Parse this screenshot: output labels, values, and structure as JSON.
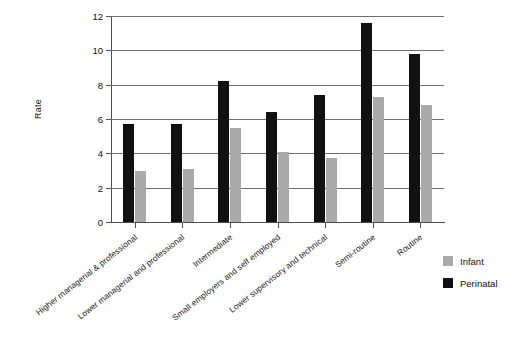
{
  "chart_data": {
    "type": "bar",
    "title": "",
    "subtitle": "",
    "xlabel": "",
    "ylabel": "Rate",
    "ylim": [
      0,
      12
    ],
    "yticks": [
      0,
      2,
      4,
      6,
      8,
      10,
      12
    ],
    "grid": true,
    "legend_position": "right",
    "categories": [
      "Higher managerial & professional",
      "Lower managerial and professional",
      "Intermediate",
      "Small employers and self employed",
      "Lower supervisory and technical",
      "Semi-routine",
      "Routine"
    ],
    "series": [
      {
        "name": "Perinatal",
        "color": "#111111",
        "values": [
          5.7,
          5.7,
          8.2,
          6.4,
          7.4,
          11.6,
          9.8
        ]
      },
      {
        "name": "Infant",
        "color": "#aaaaaa",
        "values": [
          3.0,
          3.1,
          5.5,
          4.1,
          3.7,
          7.3,
          6.8
        ]
      }
    ]
  },
  "axis": {
    "y_title": "Rate",
    "y_tick_labels": [
      "0",
      "2",
      "4",
      "6",
      "8",
      "10",
      "12"
    ]
  },
  "legend": {
    "items": [
      {
        "label": "Infant",
        "color": "#aaaaaa"
      },
      {
        "label": "Perinatal",
        "color": "#111111"
      }
    ]
  }
}
